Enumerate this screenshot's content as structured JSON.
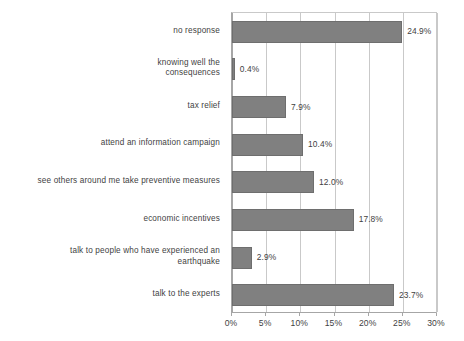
{
  "chart_data": {
    "type": "bar",
    "orientation": "horizontal",
    "title": "",
    "subtitle": "",
    "xlabel": "",
    "ylabel": "",
    "xlim": [
      0,
      30
    ],
    "grid": true,
    "legend": false,
    "legend_position": "none",
    "value_suffix": "%",
    "categories": [
      "no response",
      "knowing well the consequences",
      "tax relief",
      "attend an information campaign",
      "see others around me take preventive measures",
      "economic incentives",
      "talk to people who have experienced an earthquake",
      "talk to the experts"
    ],
    "category_lines": [
      [
        "no response"
      ],
      [
        "knowing well the",
        "consequences"
      ],
      [
        "tax relief"
      ],
      [
        "attend an information  campaign"
      ],
      [
        "see others around me take preventive measures"
      ],
      [
        "economic incentives"
      ],
      [
        "talk to people who have experienced an",
        "earthquake"
      ],
      [
        "talk to the experts"
      ]
    ],
    "values": [
      24.9,
      0.4,
      7.9,
      10.4,
      12.0,
      17.8,
      2.9,
      23.7
    ],
    "data_labels": [
      "24.9%",
      "0.4%",
      "7.9%",
      "10.4%",
      "12.0%",
      "17.8%",
      "2.9%",
      "23.7%"
    ],
    "xticks": [
      0,
      5,
      10,
      15,
      20,
      25,
      30
    ],
    "xticklabels": [
      "0%",
      "5%",
      "10%",
      "15%",
      "20%",
      "25%",
      "30%"
    ],
    "colors": {
      "bar_fill": "#808080",
      "bar_border": "#6e6e6e",
      "gridline": "#c9c9c9",
      "axis": "#a6a6a6",
      "text": "#3f3f3f",
      "background": "#ffffff"
    }
  }
}
